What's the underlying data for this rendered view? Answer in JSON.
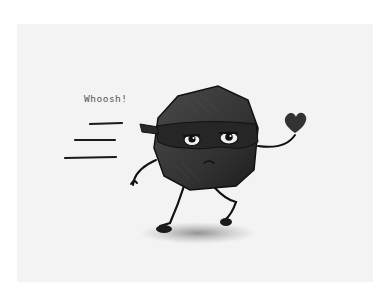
{
  "illustration": {
    "caption_text": "Whoosh!",
    "subject": "cartoon rock character wearing a ninja mask, running and holding a heart",
    "colors": {
      "background": "#ffffff",
      "paper": "#f3f3f3",
      "rock": "#3a3a3a",
      "mask": "#2a2a2a",
      "heart": "#333333",
      "shadow": "#9a9a9a",
      "line": "#111111"
    },
    "elements": [
      "speed-lines",
      "rock-body",
      "ninja-mask",
      "eyes",
      "frown-mouth",
      "arms",
      "legs",
      "heart",
      "ground-shadow"
    ]
  }
}
